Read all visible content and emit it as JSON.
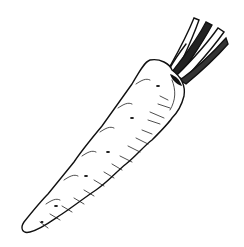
{
  "image": {
    "subject": "carrot",
    "style": "black ink line illustration",
    "background": "#ffffff",
    "ink": "#111111",
    "caption": "Carrot line drawing"
  }
}
